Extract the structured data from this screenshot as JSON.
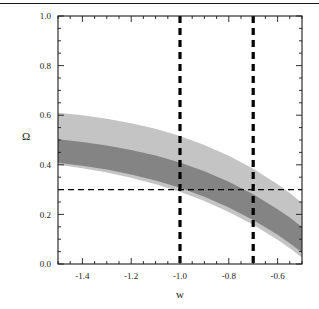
{
  "figure": {
    "top_rule_color": "#1a1a1a",
    "background": "#ffffff",
    "frame_color": "#1a1a1a"
  },
  "chart_data": {
    "type": "area",
    "title": "",
    "subtitle": "",
    "xlabel": "w",
    "ylabel": "Ω",
    "xlim": [
      -1.5,
      -0.5
    ],
    "ylim": [
      0.0,
      1.0
    ],
    "grid": false,
    "legend": "none",
    "x_ticks": [
      -1.4,
      -1.2,
      -1.0,
      -0.8,
      -0.6
    ],
    "x_tick_labels": [
      "-1.4",
      "-1.2",
      "-1.0",
      "-0.8",
      "-0.6"
    ],
    "x_minor_tick_step": 0.05,
    "y_ticks": [
      0.0,
      0.2,
      0.4,
      0.6,
      0.8,
      1.0
    ],
    "y_tick_labels": [
      "0.0",
      "0.2",
      "0.4",
      "0.6",
      "0.8",
      "1.0"
    ],
    "y_minor_tick_step": 0.05,
    "colors": {
      "outer_band": "#c4c4c4",
      "inner_band": "#848484",
      "dashed_line": "#000000",
      "frame": "#1a1a1a",
      "text": "#1a1a1a"
    },
    "series": [
      {
        "name": "outer confidence region",
        "kind": "filled-band",
        "fill": "#c4c4c4",
        "x": [
          -1.5,
          -1.4,
          -1.3,
          -1.2,
          -1.1,
          -1.0,
          -0.9,
          -0.8,
          -0.7,
          -0.6,
          -0.55,
          -0.5
        ],
        "y_upper": [
          0.61,
          0.6,
          0.586,
          0.568,
          0.545,
          0.516,
          0.48,
          0.436,
          0.384,
          0.322,
          0.286,
          0.246
        ],
        "y_lower": [
          0.4,
          0.386,
          0.369,
          0.348,
          0.322,
          0.291,
          0.254,
          0.21,
          0.158,
          0.098,
          0.064,
          0.026
        ]
      },
      {
        "name": "inner confidence region",
        "kind": "filled-band",
        "fill": "#848484",
        "x": [
          -1.5,
          -1.4,
          -1.3,
          -1.2,
          -1.1,
          -1.0,
          -0.9,
          -0.8,
          -0.7,
          -0.6,
          -0.55,
          -0.5
        ],
        "y_upper": [
          0.503,
          0.492,
          0.478,
          0.46,
          0.437,
          0.409,
          0.374,
          0.332,
          0.281,
          0.221,
          0.187,
          0.149
        ],
        "y_lower": [
          0.408,
          0.396,
          0.381,
          0.361,
          0.337,
          0.307,
          0.271,
          0.228,
          0.177,
          0.118,
          0.084,
          0.046
        ]
      }
    ],
    "reference_lines": [
      {
        "name": "w-equals-minus-one",
        "orientation": "vertical",
        "value": -1.0,
        "style": "dashed",
        "color": "#000000",
        "width": 3
      },
      {
        "name": "w-equals-minus-zero-point-seven",
        "orientation": "vertical",
        "value": -0.7,
        "style": "dashed",
        "color": "#000000",
        "width": 3
      },
      {
        "name": "omega-equals-zero-point-three",
        "orientation": "horizontal",
        "value": 0.3,
        "style": "dashed",
        "color": "#000000",
        "width": 1
      }
    ]
  }
}
